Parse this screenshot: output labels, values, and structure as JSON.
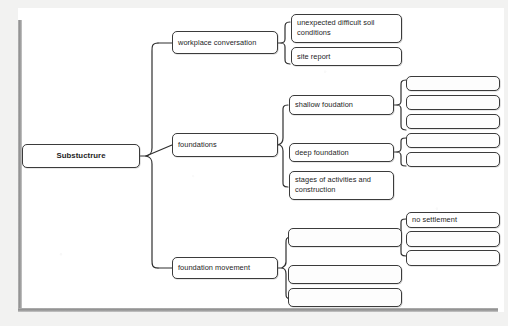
{
  "diagram": {
    "colors": {
      "box_border": "#3b3b3b",
      "brace_stroke": "#2f2f2f",
      "frame": "#8d8d8d",
      "paper": "#ffffff",
      "background": "#f2f2f1"
    },
    "root": {
      "label": "Substuctrure"
    },
    "branches": [
      {
        "id": "workplace-conversation",
        "label": "workplace conversation",
        "children": [
          {
            "id": "unexpected-difficult-soil-conditions",
            "label": "unexpected difficult soil conditions"
          },
          {
            "id": "site-report",
            "label": "site report"
          }
        ]
      },
      {
        "id": "foundations",
        "label": "foundations",
        "children": [
          {
            "id": "shallow-foudation",
            "label": "shallow foudation",
            "children": [
              {
                "id": "shallow-child-1",
                "label": ""
              },
              {
                "id": "shallow-child-2",
                "label": ""
              },
              {
                "id": "shallow-child-3",
                "label": ""
              }
            ]
          },
          {
            "id": "deep-foundation",
            "label": "deep foundation",
            "children": [
              {
                "id": "deep-child-1",
                "label": ""
              },
              {
                "id": "deep-child-2",
                "label": ""
              }
            ]
          },
          {
            "id": "stages-of-activities-and-construction",
            "label": "stages of activities and construction",
            "children": []
          }
        ]
      },
      {
        "id": "foundation-movement",
        "label": "foundation movement",
        "children": [
          {
            "id": "movement-child-1",
            "label": "",
            "children": [
              {
                "id": "no-settlement",
                "label": "no settlement"
              },
              {
                "id": "settlement-child-2",
                "label": ""
              },
              {
                "id": "settlement-child-3",
                "label": ""
              }
            ]
          },
          {
            "id": "movement-child-2",
            "label": ""
          },
          {
            "id": "movement-child-3",
            "label": ""
          }
        ]
      }
    ]
  }
}
